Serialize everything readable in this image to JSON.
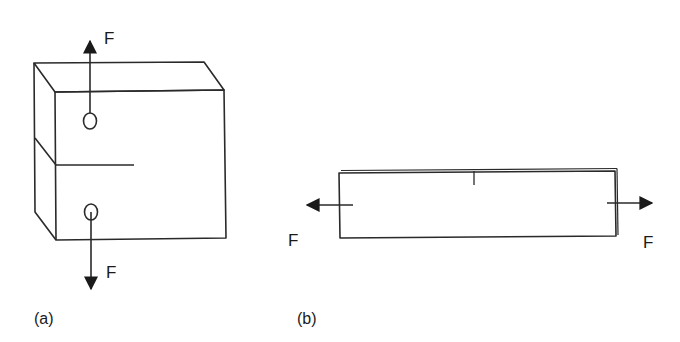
{
  "figure_a": {
    "caption": "(a)",
    "description": "Compact tension specimen with crack, loaded by pins",
    "force_top_label": "F",
    "force_bottom_label": "F"
  },
  "figure_b": {
    "caption": "(b)",
    "description": "Plate with edge notch loaded in tension",
    "force_left_label": "F",
    "force_right_label": "F"
  },
  "colors": {
    "line": "#2a2a2a",
    "background": "#ffffff"
  }
}
